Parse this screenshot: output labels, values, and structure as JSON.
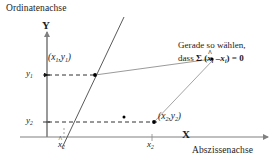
{
  "figure": {
    "title_alt": "Lineare Regression - Abweichungen",
    "background_color": "#ffffff",
    "ink_color": "#1a1a1a"
  },
  "axes": {
    "y_axis_name": "Ordinatenachse",
    "y_axis_letter": "Y",
    "x_axis_name": "Abszissenachse",
    "x_axis_letter": "X"
  },
  "ticks": {
    "y": [
      {
        "id": "y1",
        "base": "y",
        "sub": "1"
      },
      {
        "id": "y2",
        "base": "y",
        "sub": "2"
      }
    ],
    "x": [
      {
        "id": "xhat2",
        "base": "x",
        "sub": "2",
        "hat": "^"
      },
      {
        "id": "x2",
        "base": "x",
        "sub": "2",
        "hat": ""
      }
    ]
  },
  "points": [
    {
      "id": "p1",
      "open_paren": "(",
      "x_base": "x",
      "x_sub": "1",
      "comma": ",",
      "y_base": "y",
      "y_sub": "1",
      "close_paren": ")"
    },
    {
      "id": "p2",
      "open_paren": "(",
      "x_base": "x",
      "x_sub": "2",
      "comma": ",",
      "y_base": "y",
      "y_sub": "2",
      "close_paren": ")"
    }
  ],
  "annotation": {
    "line1": "Gerade so wählen,",
    "line2_prefix": "dass ",
    "sigma": "Σ",
    "line2_open": " (",
    "x_hat_base": "x",
    "x_hat_sub": "i",
    "hat_mark": "^",
    "minus": " –",
    "x_base": "x",
    "x_sub": "i",
    "line2_close": ") = ",
    "zero": "0"
  },
  "colors": {
    "axis": "#808080",
    "regression_line": "#555555",
    "connector": "#8a8a8a",
    "dashed_guide": "#1a1a1a",
    "marker": "#000000"
  }
}
